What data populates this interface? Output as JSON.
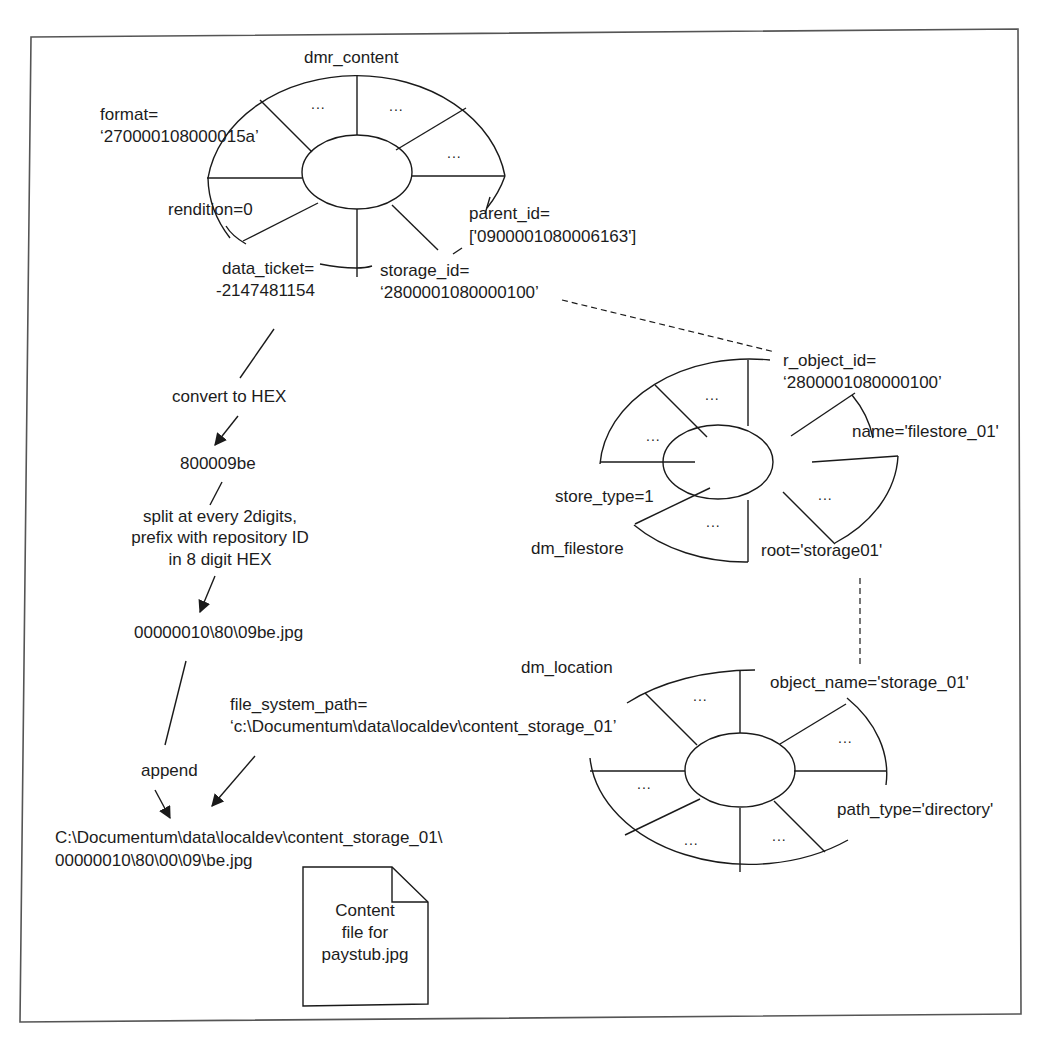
{
  "figure": {
    "entities": {
      "dmr_content": {
        "title": "dmr_content",
        "attributes": {
          "format": {
            "label": "format=",
            "value": "‘270000108000015a’"
          },
          "rendition": {
            "label": "rendition=0"
          },
          "data_ticket": {
            "label": "data_ticket=",
            "value": "-2147481154"
          },
          "storage_id": {
            "label": "storage_id=",
            "value": "‘2800001080000100’"
          },
          "parent_id": {
            "label": "parent_id=",
            "value": "['0900001080006163']"
          }
        },
        "placeholders": [
          "...",
          "...",
          "..."
        ]
      },
      "dm_filestore": {
        "title": "dm_filestore",
        "attributes": {
          "r_object_id": {
            "label": "r_object_id=",
            "value": "‘2800001080000100’"
          },
          "name": {
            "label": "name='filestore_01'"
          },
          "store_type": {
            "label": "store_type=1"
          },
          "root": {
            "label": "root='storage01'"
          }
        },
        "placeholders": [
          "...",
          "...",
          "...",
          "..."
        ]
      },
      "dm_location": {
        "title": "dm_location",
        "attributes": {
          "object_name": {
            "label": "object_name='storage_01'"
          },
          "path_type": {
            "label": "path_type='directory'"
          },
          "file_system_path": {
            "label": "file_system_path=",
            "value": "‘c:\\Documentum\\data\\localdev\\content_storage_01’"
          }
        },
        "placeholders": [
          "...",
          "...",
          "...",
          "...",
          "..."
        ]
      }
    },
    "flow": {
      "step1": "convert to HEX",
      "result1": "800009be",
      "step2_line1": "split at every 2digits,",
      "step2_line2": "prefix with repository ID",
      "step2_line3": "in 8 digit HEX",
      "result2": "00000010\\80\\09be.jpg",
      "step3": "append",
      "final_line1": "C:\\Documentum\\data\\localdev\\content_storage_01\\",
      "final_line2": "00000010\\80\\00\\09\\be.jpg"
    },
    "document": {
      "line1": "Content",
      "line2": "file for",
      "line3": "paystub.jpg"
    },
    "colors": {
      "stroke": "#1a1a1a",
      "frame": "#555555",
      "background": "#ffffff"
    }
  }
}
